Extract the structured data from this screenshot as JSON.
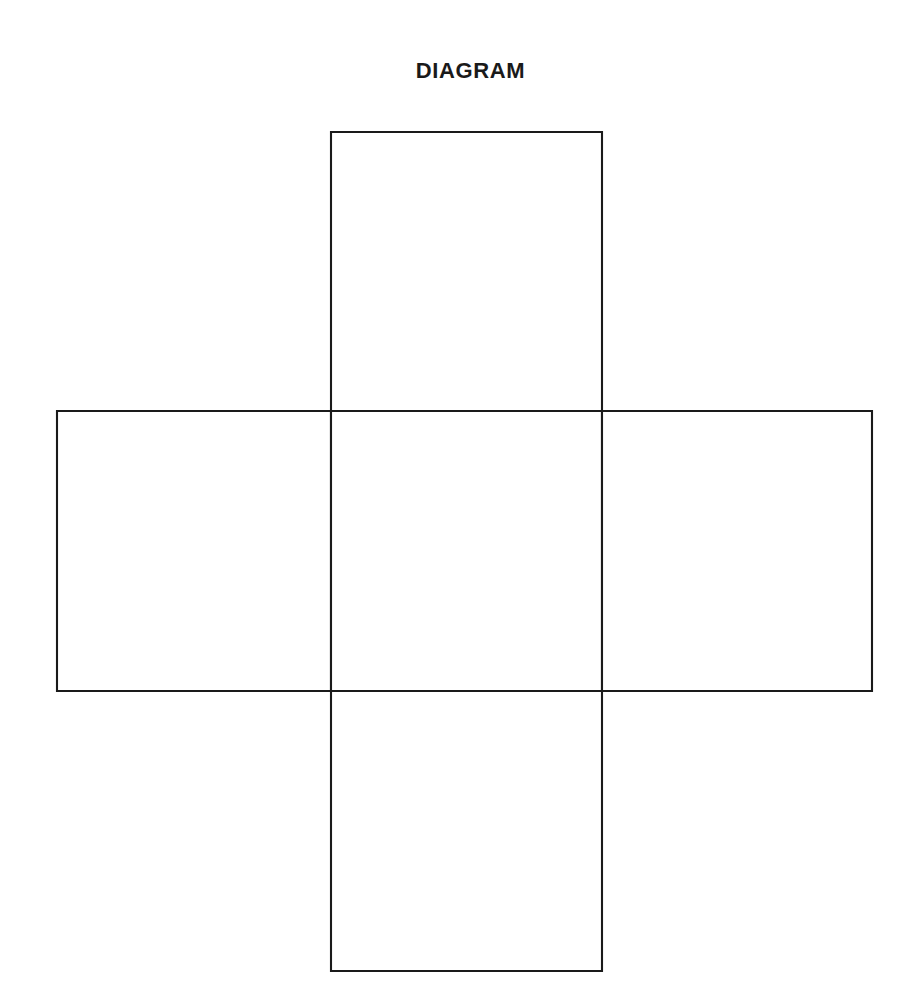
{
  "page": {
    "background_color": "#ffffff",
    "width": 923,
    "height": 1008
  },
  "title": {
    "text": "DIAGRAM",
    "color": "#1a1a1a"
  },
  "figure": {
    "kind": "cross-shaped-net",
    "stroke_color": "#1a1a1a",
    "fill_color": "#ffffff",
    "stroke_width": 2,
    "cells": [
      {
        "name": "top-cell",
        "label": "",
        "x": 331,
        "y": 132,
        "width": 271,
        "height": 279
      },
      {
        "name": "left-cell",
        "label": "",
        "x": 57,
        "y": 411,
        "width": 274,
        "height": 280
      },
      {
        "name": "center-cell",
        "label": "",
        "x": 331,
        "y": 411,
        "width": 271,
        "height": 280
      },
      {
        "name": "right-cell",
        "label": "",
        "x": 602,
        "y": 411,
        "width": 270,
        "height": 280
      },
      {
        "name": "bottom-cell",
        "label": "",
        "x": 331,
        "y": 691,
        "width": 271,
        "height": 280
      }
    ]
  }
}
